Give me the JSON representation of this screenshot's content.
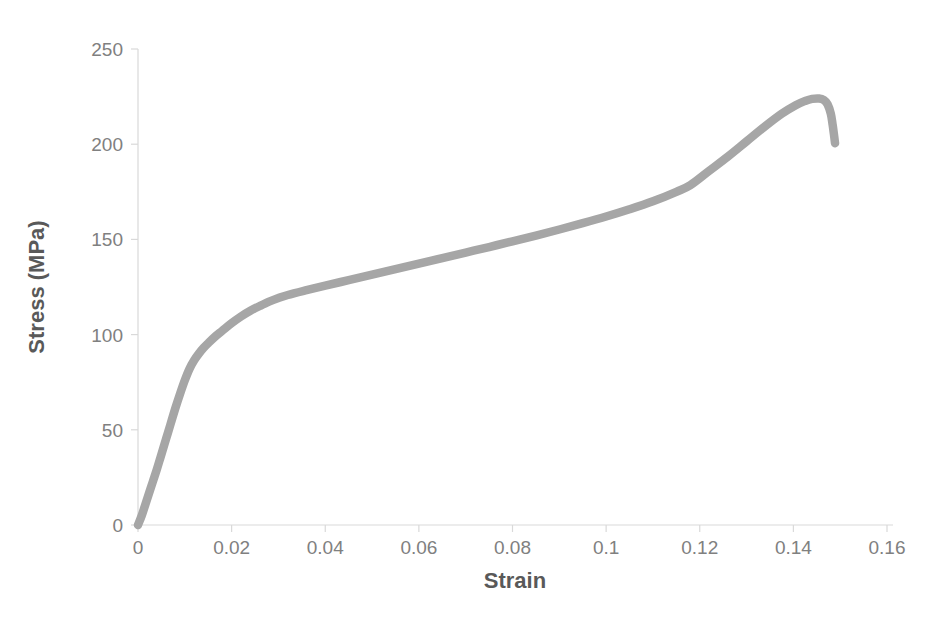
{
  "chart_data": {
    "type": "line",
    "title": "",
    "xlabel": "Strain",
    "ylabel": "Stress (MPa)",
    "xlim": [
      0,
      0.16
    ],
    "ylim": [
      0,
      250
    ],
    "grid": false,
    "legend": false,
    "legend_position": "none",
    "series_color": "#a6a6a6",
    "axis_color": "#d9d9d9",
    "tick_label_color": "#808080",
    "axis_title_color": "#595959",
    "xticks": [
      "0",
      "0.02",
      "0.04",
      "0.06",
      "0.08",
      "0.1",
      "0.12",
      "0.14",
      "0.16"
    ],
    "xtick_values": [
      0,
      0.02,
      0.04,
      0.06,
      0.08,
      0.1,
      0.12,
      0.14,
      0.16
    ],
    "yticks": [
      "0",
      "50",
      "100",
      "150",
      "200",
      "250"
    ],
    "ytick_values": [
      0,
      50,
      100,
      150,
      200,
      250
    ],
    "series": [
      {
        "name": "Stress-Strain Curve",
        "x": [
          0.0,
          0.0008,
          0.0016,
          0.0024,
          0.0032,
          0.004,
          0.0048,
          0.0056,
          0.0064,
          0.0072,
          0.008,
          0.009,
          0.01,
          0.011,
          0.012,
          0.013,
          0.014,
          0.015,
          0.0165,
          0.018,
          0.02,
          0.022,
          0.024,
          0.026,
          0.028,
          0.03,
          0.032,
          0.036,
          0.04,
          0.045,
          0.05,
          0.055,
          0.06,
          0.065,
          0.07,
          0.075,
          0.08,
          0.085,
          0.09,
          0.095,
          0.1,
          0.105,
          0.11,
          0.115,
          0.118,
          0.122,
          0.126,
          0.13,
          0.134,
          0.1375,
          0.1405,
          0.1425,
          0.144,
          0.1455,
          0.1465,
          0.1473,
          0.148,
          0.1484,
          0.1487,
          0.1489
        ],
        "y": [
          0.0,
          5.0,
          11.0,
          17.0,
          23.0,
          29.0,
          35.5,
          42.0,
          48.5,
          55.0,
          61.5,
          69.0,
          76.0,
          82.0,
          86.5,
          90.0,
          93.0,
          95.5,
          99.0,
          102.0,
          106.0,
          109.5,
          112.5,
          115.0,
          117.3,
          119.2,
          120.8,
          123.3,
          125.7,
          128.6,
          131.5,
          134.4,
          137.3,
          140.2,
          143.1,
          146.0,
          149.0,
          152.0,
          155.2,
          158.5,
          162.0,
          165.8,
          170.0,
          175.0,
          178.5,
          186.0,
          193.5,
          201.5,
          209.5,
          216.0,
          220.5,
          222.7,
          223.8,
          224.0,
          223.2,
          221.0,
          216.0,
          210.0,
          204.5,
          200.5
        ],
        "ultimate_tensile_strength": 224.0,
        "strain_at_uts": 0.144,
        "fracture_stress": 200.5,
        "fracture_strain": 0.149,
        "yield_knee_strain": 0.032,
        "yield_knee_stress": 120.8
      }
    ]
  }
}
